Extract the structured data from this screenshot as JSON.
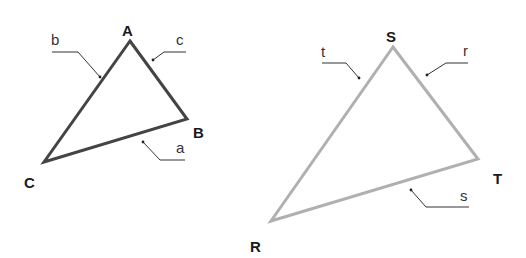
{
  "figures": [
    {
      "id": "triangle-abc",
      "stroke_color": "#444444",
      "vertices": [
        {
          "label": "A",
          "x": 130,
          "y": 41,
          "label_x": 122,
          "label_y": 24
        },
        {
          "label": "B",
          "x": 187,
          "y": 119,
          "label_x": 193,
          "label_y": 126
        },
        {
          "label": "C",
          "x": 44,
          "y": 162,
          "label_x": 24,
          "label_y": 176
        }
      ],
      "sides": [
        {
          "label": "b",
          "label_x": 51,
          "label_y": 45,
          "leader": "52,52 78,52 100,77",
          "dot_x": 100,
          "dot_y": 77
        },
        {
          "label": "c",
          "label_x": 176,
          "label_y": 45,
          "leader": "186,52 164,52 153,60",
          "dot_x": 153,
          "dot_y": 60
        },
        {
          "label": "a",
          "label_x": 176,
          "label_y": 153,
          "leader": "143,142 160,160 185,160",
          "dot_x": 143,
          "dot_y": 142
        }
      ]
    },
    {
      "id": "triangle-rst",
      "stroke_color": "#b0b0b0",
      "vertices": [
        {
          "label": "S",
          "x": 393,
          "y": 47,
          "label_x": 386,
          "label_y": 30
        },
        {
          "label": "T",
          "x": 478,
          "y": 159,
          "label_x": 493,
          "label_y": 172
        },
        {
          "label": "R",
          "x": 271,
          "y": 221,
          "label_x": 250,
          "label_y": 240
        }
      ],
      "sides": [
        {
          "label": "t",
          "label_x": 321,
          "label_y": 57,
          "leader": "322,63 346,63 359,78",
          "dot_x": 359,
          "dot_y": 78
        },
        {
          "label": "r",
          "label_x": 463,
          "label_y": 56,
          "leader": "468,63 446,63 427,75",
          "dot_x": 427,
          "dot_y": 75
        },
        {
          "label": "s",
          "label_x": 460,
          "label_y": 201,
          "leader": "411,190 426,207 469,207",
          "dot_x": 411,
          "dot_y": 190
        }
      ]
    }
  ]
}
